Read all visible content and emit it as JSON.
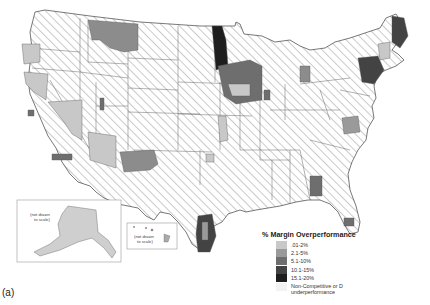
{
  "figure": {
    "label": "(a)"
  },
  "legend": {
    "title": "% Margin Overperformance",
    "items": [
      {
        "label": ".01-2%",
        "color": "#c8c8c8"
      },
      {
        "label": "2.1-5%",
        "color": "#9a9a9a"
      },
      {
        "label": "5.1-10%",
        "color": "#6e6e6e"
      },
      {
        "label": "10.1-15%",
        "color": "#434343"
      },
      {
        "label": "15.1-20%",
        "color": "#1e1e1e"
      },
      {
        "label": "Non-Competitive or D underperformance",
        "color": "#f2f2f2"
      }
    ]
  },
  "insets": {
    "alaska_note": "(not drawn to scale)",
    "hawaii_note": "(not drawn to scale)"
  }
}
